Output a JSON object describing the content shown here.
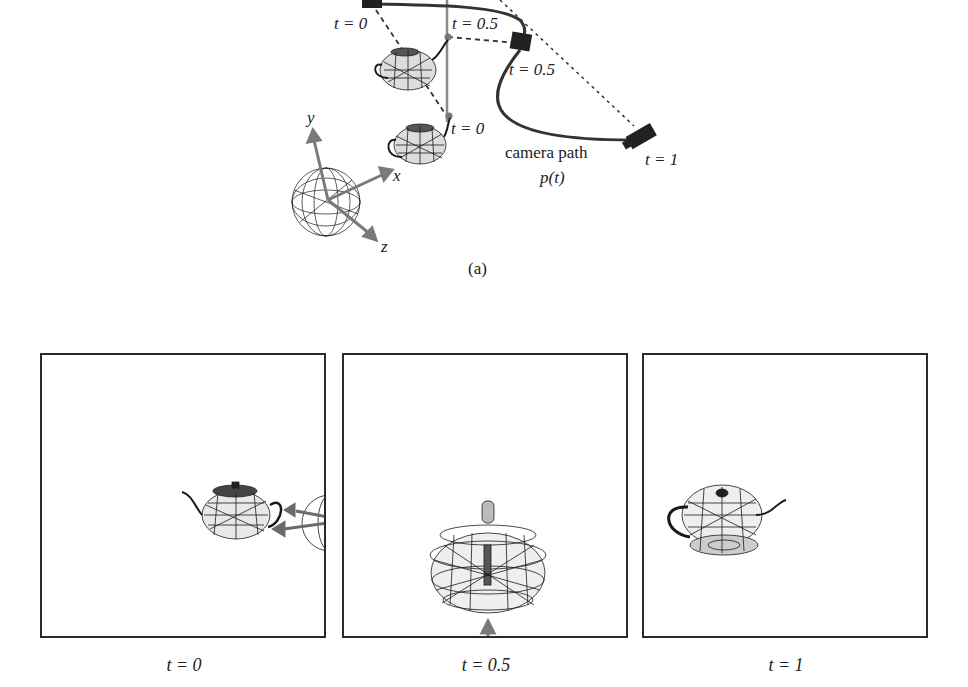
{
  "figure": {
    "top_diagram": {
      "subcaption": "(a)",
      "axes": {
        "x_label": "x",
        "y_label": "y",
        "z_label": "z"
      },
      "object_path_labels": [
        "t = 0",
        "t = 0.5"
      ],
      "camera_labels": {
        "start": "t = 0",
        "mid": "t = 0.5",
        "end": "t = 1"
      },
      "object_top_label": "t = 0.5",
      "object_bottom_label": "t = 0",
      "camera_path_label": "camera path",
      "camera_path_symbol": "p(t)"
    },
    "panels": [
      {
        "label": "t = 0",
        "view": "teapot side view, spout left, world axes sphere at right edge"
      },
      {
        "label": "t = 0.5",
        "view": "teapot viewed from spout direction, y-axis arrow at bottom"
      },
      {
        "label": "t = 1",
        "view": "teapot tilted from below, spout right"
      }
    ],
    "colors": {
      "frame": "#2a2a2a",
      "wireframe": "#1a1a1a",
      "axis_arrow": "#7a7a7a",
      "camera": "#222222"
    }
  }
}
